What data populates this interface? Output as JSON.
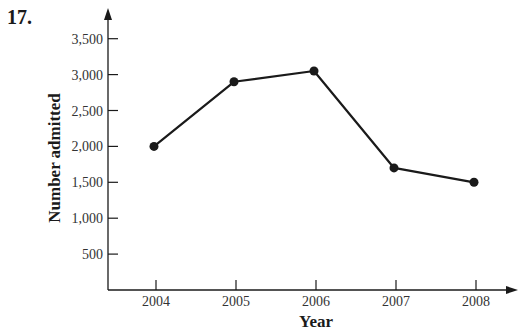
{
  "problem": {
    "number": "17."
  },
  "chart_data": {
    "type": "line",
    "title": "",
    "xlabel": "Year",
    "ylabel": "Number admitted",
    "categories": [
      "2004",
      "2005",
      "2006",
      "2007",
      "2008"
    ],
    "values": [
      2000,
      2900,
      3050,
      1700,
      1500
    ],
    "yticks": [
      500,
      1000,
      1500,
      2000,
      2500,
      3000,
      3500
    ],
    "ytick_labels": [
      "500",
      "1,000",
      "1,500",
      "2,000",
      "2,500",
      "3,000",
      "3,500"
    ],
    "ylim": [
      0,
      3500
    ],
    "grid": false,
    "legend": null,
    "markers": "filled-circle",
    "line_color": "#1a1a1a"
  }
}
